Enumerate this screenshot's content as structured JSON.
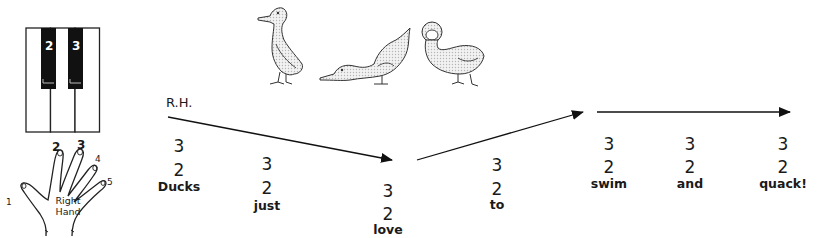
{
  "piano": {
    "black_keys": [
      {
        "finger": "2"
      },
      {
        "finger": "3"
      }
    ]
  },
  "hand": {
    "label_line1": "Right",
    "label_line2": "Hand",
    "fingers": [
      "1",
      "2",
      "3",
      "4",
      "5"
    ]
  },
  "illustration": {
    "ducks": [
      "duck-standing",
      "duck-bending",
      "duck-facing-forward"
    ]
  },
  "melody": {
    "hand_label": "R.H.",
    "notes": [
      {
        "upper": "3",
        "lower": "2",
        "lyric": "Ducks"
      },
      {
        "upper": "3",
        "lower": "2",
        "lyric": "just"
      },
      {
        "upper": "3",
        "lower": "2",
        "lyric": "love"
      },
      {
        "upper": "3",
        "lower": "2",
        "lyric": "to"
      },
      {
        "upper": "3",
        "lower": "2",
        "lyric": "swim"
      },
      {
        "upper": "3",
        "lower": "2",
        "lyric": "and"
      },
      {
        "upper": "3",
        "lower": "2",
        "lyric": "quack!"
      }
    ],
    "direction_arrows": [
      "down",
      "up",
      "level"
    ]
  }
}
